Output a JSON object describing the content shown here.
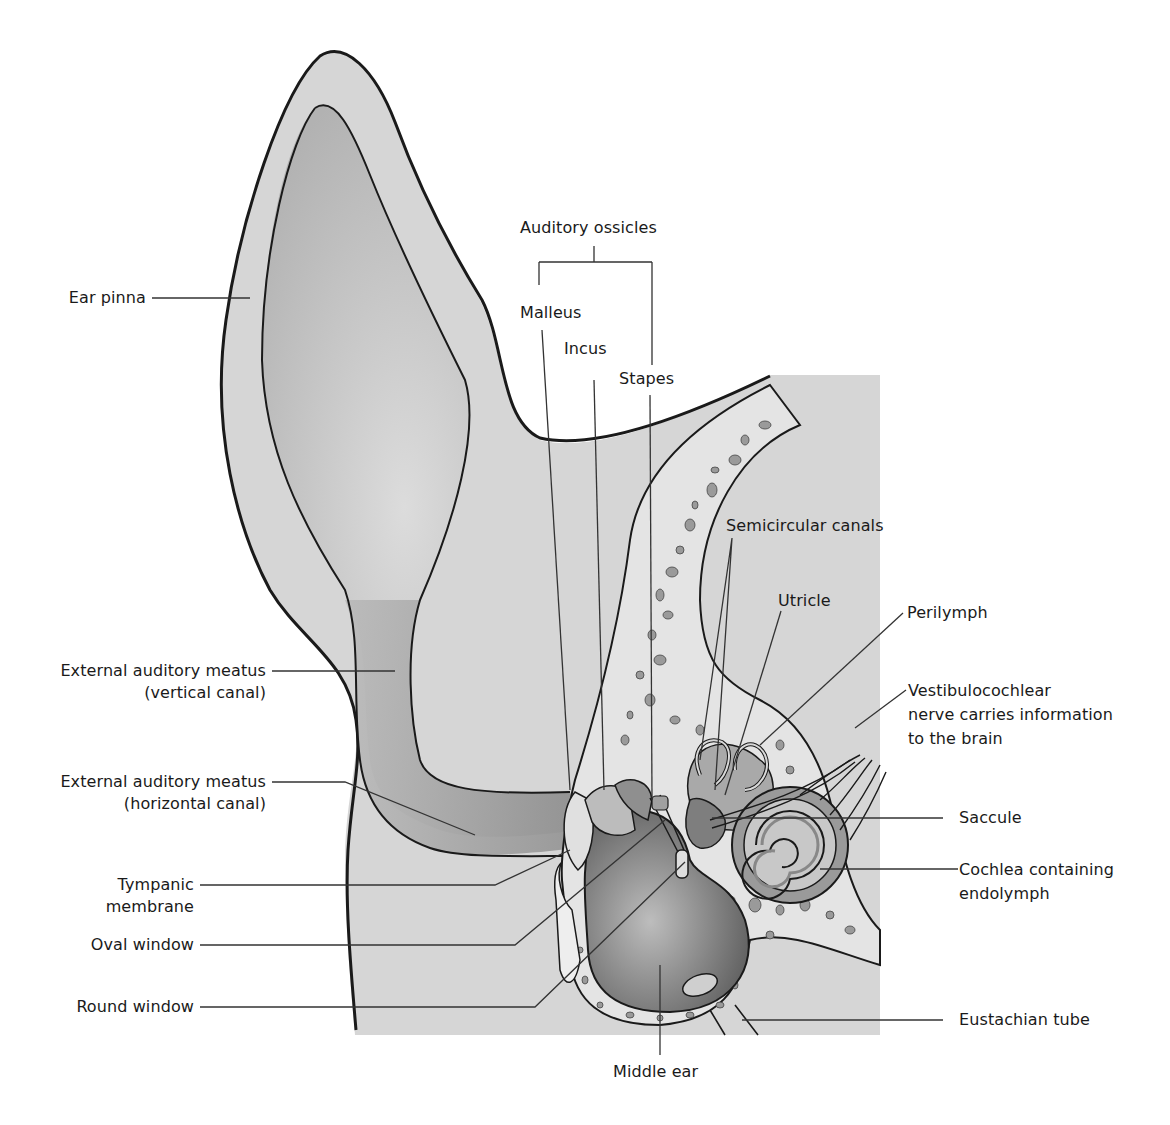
{
  "diagram": {
    "colors": {
      "skin": "#d6d6d6",
      "skin_dark": "#bdbdbd",
      "canal": "#a8a8a8",
      "bone": "#e4e4e4",
      "bone_pore": "#8e8e8e",
      "cavity": "#8a8a8a",
      "outline": "#1a1a1a",
      "leader": "#333333",
      "text": "#1a1a1a"
    }
  },
  "labels": {
    "auditory_ossicles": "Auditory ossicles",
    "malleus": "Malleus",
    "incus": "Incus",
    "stapes": "Stapes",
    "ear_pinna": "Ear pinna",
    "eam_vertical_1": "External auditory meatus",
    "eam_vertical_2": "(vertical canal)",
    "eam_horizontal_1": "External auditory meatus",
    "eam_horizontal_2": "(horizontal canal)",
    "tympanic_1": "Tympanic",
    "tympanic_2": "membrane",
    "oval_window": "Oval window",
    "round_window": "Round window",
    "semicircular_canals": "Semicircular canals",
    "utricle": "Utricle",
    "perilymph": "Perilymph",
    "vestibulocochlear_1": "Vestibulocochlear",
    "vestibulocochlear_2": "nerve carries information",
    "vestibulocochlear_3": "to the brain",
    "saccule": "Saccule",
    "cochlea_1": "Cochlea containing",
    "cochlea_2": "endolymph",
    "eustachian_tube": "Eustachian tube",
    "middle_ear": "Middle ear"
  }
}
